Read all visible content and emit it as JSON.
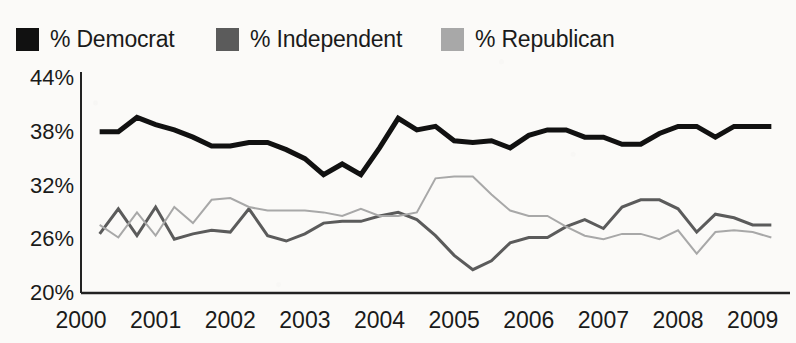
{
  "legend": {
    "position": "top-left",
    "items": [
      {
        "label": "% Democrat",
        "color": "#111111",
        "icon": "legend-swatch"
      },
      {
        "label": "% Independent",
        "color": "#5b5b5b",
        "icon": "legend-swatch"
      },
      {
        "label": "% Republican",
        "color": "#a8a8a8",
        "icon": "legend-swatch"
      }
    ]
  },
  "chart_data": {
    "type": "line",
    "title": "",
    "subtitle": "",
    "xlabel": "",
    "ylabel": "",
    "xlim": [
      2000,
      2009.5
    ],
    "ylim": [
      20,
      44
    ],
    "yticks": [
      "20%",
      "26%",
      "32%",
      "38%",
      "44%"
    ],
    "ytick_values": [
      20,
      26,
      32,
      38,
      44
    ],
    "xticks": [
      "2000",
      "2001",
      "2002",
      "2003",
      "2004",
      "2005",
      "2006",
      "2007",
      "2008",
      "2009"
    ],
    "xtick_values": [
      2000,
      2001,
      2002,
      2003,
      2004,
      2005,
      2006,
      2007,
      2008,
      2009
    ],
    "grid": false,
    "legend_position": "above-plot",
    "x": [
      2000.25,
      2000.5,
      2000.75,
      2001.0,
      2001.25,
      2001.5,
      2001.75,
      2002.0,
      2002.25,
      2002.5,
      2002.75,
      2003.0,
      2003.25,
      2003.5,
      2003.75,
      2004.0,
      2004.25,
      2004.5,
      2004.75,
      2005.0,
      2005.25,
      2005.5,
      2005.75,
      2006.0,
      2006.25,
      2006.5,
      2006.75,
      2007.0,
      2007.25,
      2007.5,
      2007.75,
      2008.0,
      2008.25,
      2008.5,
      2008.75,
      2009.0,
      2009.25
    ],
    "series": [
      {
        "name": "% Democrat",
        "color": "#111111",
        "linewidth": 5,
        "values": [
          38.0,
          38.0,
          39.6,
          38.8,
          38.2,
          37.4,
          36.4,
          36.4,
          36.8,
          36.8,
          36.0,
          35.0,
          33.2,
          34.4,
          33.2,
          36.2,
          39.5,
          38.2,
          38.6,
          37.0,
          36.8,
          37.0,
          36.2,
          37.6,
          38.2,
          38.2,
          37.4,
          37.4,
          36.6,
          36.6,
          37.8,
          38.6,
          38.6,
          37.4,
          38.6,
          38.6,
          38.6
        ]
      },
      {
        "name": "% Independent",
        "color": "#5b5b5b",
        "linewidth": 3,
        "values": [
          26.6,
          29.4,
          26.4,
          29.6,
          26.0,
          26.6,
          27.0,
          26.8,
          29.4,
          26.4,
          25.8,
          26.6,
          27.8,
          28.0,
          28.0,
          28.6,
          29.0,
          28.2,
          26.4,
          24.2,
          22.6,
          23.6,
          25.6,
          26.2,
          26.2,
          27.4,
          28.2,
          27.2,
          29.6,
          30.4,
          30.4,
          29.4,
          26.8,
          28.8,
          28.4,
          27.6,
          27.6
        ]
      },
      {
        "name": "% Republican",
        "color": "#a8a8a8",
        "linewidth": 2,
        "values": [
          27.6,
          26.2,
          29.0,
          26.4,
          29.6,
          27.8,
          30.4,
          30.6,
          29.6,
          29.2,
          29.2,
          29.2,
          29.0,
          28.6,
          29.4,
          28.6,
          28.6,
          29.0,
          32.8,
          33.0,
          33.0,
          31.0,
          29.2,
          28.6,
          28.6,
          27.4,
          26.4,
          26.0,
          26.6,
          26.6,
          26.0,
          27.0,
          24.4,
          26.8,
          27.0,
          26.8,
          26.2
        ]
      }
    ]
  }
}
